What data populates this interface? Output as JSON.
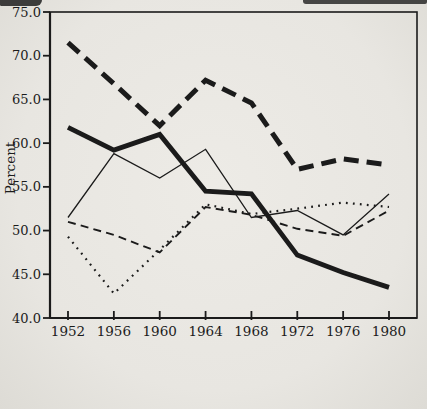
{
  "page": {
    "background": "#e8e6e1",
    "ink": "#1b1b1b"
  },
  "chart_data": {
    "type": "line",
    "title": "",
    "xlabel": "",
    "ylabel": "Percent",
    "ylim": [
      40.0,
      75.0
    ],
    "ytick_interval": 5.0,
    "ytick_labels": [
      "40.0",
      "45.0",
      "50.0",
      "55.0",
      "60.0",
      "65.0",
      "70.0",
      "75.0"
    ],
    "categories": [
      "1952",
      "1956",
      "1960",
      "1964",
      "1968",
      "1972",
      "1976",
      "1980"
    ],
    "grid": false,
    "legend_position": "bottom-key",
    "series": [
      {
        "name": "Northeast",
        "line_style": "dotted",
        "values": [
          49.3,
          42.8,
          47.8,
          53.0,
          51.9,
          52.5,
          53.2,
          52.7
        ]
      },
      {
        "name": "Midwest",
        "line_style": "dashed",
        "values": [
          51.0,
          49.5,
          47.5,
          52.7,
          51.8,
          50.2,
          49.4,
          52.3
        ]
      },
      {
        "name": "South",
        "line_style": "heavy-dashed",
        "values": [
          71.5,
          66.8,
          62.0,
          67.2,
          64.6,
          57.0,
          58.2,
          57.5
        ]
      },
      {
        "name": "Mountain",
        "line_style": "solid-thick",
        "values": [
          61.8,
          59.2,
          61.0,
          54.5,
          54.2,
          47.2,
          45.2,
          43.5
        ]
      },
      {
        "name": "Pacific Coast",
        "line_style": "solid-thin",
        "values": [
          51.5,
          58.8,
          56.0,
          59.3,
          51.5,
          52.3,
          49.5,
          54.2
        ]
      }
    ]
  },
  "key": {
    "label": "Key:",
    "rows": [
      [
        0,
        1,
        2
      ],
      [
        3,
        4
      ]
    ]
  }
}
